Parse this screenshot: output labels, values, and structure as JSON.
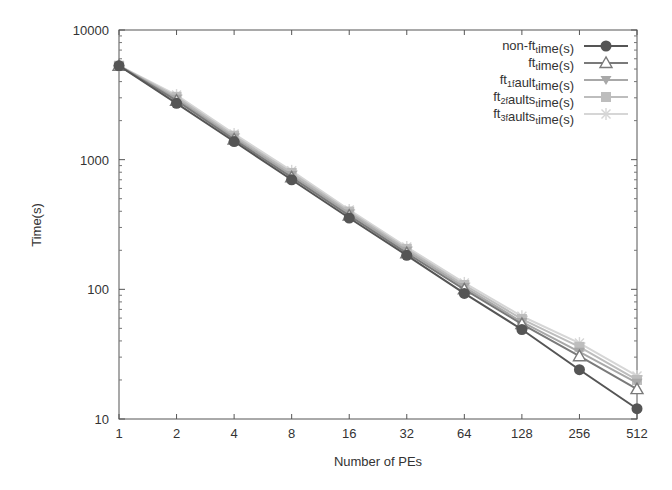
{
  "chart_data": {
    "type": "line",
    "title": "",
    "xlabel": "Number of PEs",
    "ylabel": "Time(s)",
    "x_scale": "log2",
    "y_scale": "log10",
    "x": [
      1,
      2,
      4,
      8,
      16,
      32,
      64,
      128,
      256,
      512
    ],
    "x_tick_labels": [
      "1",
      "2",
      "4",
      "8",
      "16",
      "32",
      "64",
      "128",
      "256",
      "512"
    ],
    "y_ticks": [
      10,
      100,
      1000,
      10000
    ],
    "y_tick_labels": [
      "10",
      "100",
      "1000",
      "10000"
    ],
    "ylim": [
      10,
      10000
    ],
    "xlim": [
      1,
      512
    ],
    "grid": false,
    "legend_position": "top-right",
    "series": [
      {
        "name": "non-ft_time(s)",
        "legend_label": "non-ft_time(s)",
        "marker": "circle",
        "color": "#555555",
        "values": [
          5300,
          2720,
          1380,
          700,
          355,
          183,
          93,
          49,
          24,
          12
        ]
      },
      {
        "name": "ft_time(s)",
        "legend_label": "ft_time(s)",
        "marker": "triangle-up",
        "color": "#7a7a7a",
        "values": [
          5300,
          2850,
          1430,
          730,
          370,
          190,
          100,
          54,
          30.5,
          17
        ]
      },
      {
        "name": "ft_1fault_time(s)",
        "legend_label": "ft_1fault_time(s)",
        "marker": "triangle-down",
        "color": "#a8a8a8",
        "values": [
          5300,
          2950,
          1480,
          760,
          385,
          198,
          104,
          56,
          33,
          19
        ]
      },
      {
        "name": "ft_2faults_time(s)",
        "legend_label": "ft_2faults_time(s)",
        "marker": "square",
        "color": "#bdbdbd",
        "values": [
          5300,
          3050,
          1530,
          790,
          398,
          205,
          108,
          59,
          36,
          20
        ]
      },
      {
        "name": "ft_3faults_time(s)",
        "legend_label": "ft_3faults_time(s)",
        "marker": "star",
        "color": "#d6d6d6",
        "values": [
          5300,
          3150,
          1580,
          820,
          410,
          212,
          112,
          62,
          38.5,
          21.5
        ]
      }
    ]
  },
  "legend": {
    "items": [
      {
        "pre": "non-ft",
        "sub": "t",
        "post": "ime(s)"
      },
      {
        "pre": "ft",
        "sub": "t",
        "post": "ime(s)"
      },
      {
        "pre": "ft",
        "sub": "1f",
        "post": "ault",
        "sub2": "t",
        "post2": "ime(s)"
      },
      {
        "pre": "ft",
        "sub": "2f",
        "post": "aults",
        "sub2": "t",
        "post2": "ime(s)"
      },
      {
        "pre": "ft",
        "sub": "3f",
        "post": "aults",
        "sub2": "t",
        "post2": "ime(s)"
      }
    ]
  }
}
